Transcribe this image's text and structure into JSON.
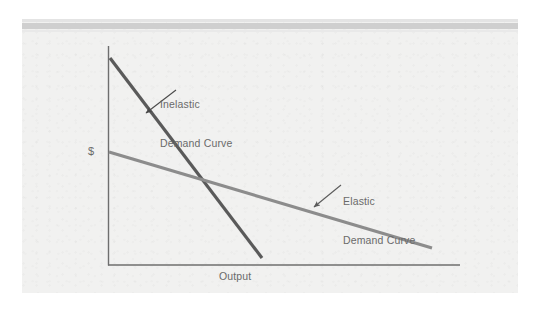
{
  "figure": {
    "background_color": "#f1f1f0",
    "page_color": "#ffffff"
  },
  "axes": {
    "y_label": "$",
    "x_label": "Output",
    "axis_color": "#6e6e6e"
  },
  "annotations": {
    "inelastic": {
      "line1": "Inelastic",
      "line2": "Demand Curve"
    },
    "elastic": {
      "line1": "Elastic",
      "line2": "Demand Curve"
    }
  },
  "chart_data": {
    "type": "line",
    "xlabel": "Output",
    "ylabel": "$",
    "grid": false,
    "legend": "none",
    "axis_origin_px": [
      108,
      265
    ],
    "axis_x_end_px": [
      460,
      265
    ],
    "axis_y_top_px": [
      108,
      46
    ],
    "xlim": [
      0,
      1
    ],
    "ylim": [
      0,
      1
    ],
    "series": [
      {
        "name": "Inelastic Demand Curve",
        "color": "#5a5a5a",
        "width_px": 3.2,
        "points_px": [
          [
            110,
            58
          ],
          [
            262,
            258
          ]
        ],
        "points_norm": [
          [
            0.006,
            0.945
          ],
          [
            0.438,
            0.032
          ]
        ],
        "slope_desc": "steep negative slope",
        "annotation": {
          "text_px": [
            160,
            72
          ],
          "arrow_from_px": [
            176,
            90
          ],
          "arrow_to_px": [
            146,
            113
          ]
        }
      },
      {
        "name": "Elastic Demand Curve",
        "color": "#8c8c8c",
        "width_px": 3.2,
        "points_px": [
          [
            109,
            152
          ],
          [
            432,
            248
          ]
        ],
        "points_norm": [
          [
            0.003,
            0.516
          ],
          [
            0.92,
            0.078
          ]
        ],
        "slope_desc": "shallow negative slope",
        "annotation": {
          "text_px": [
            343,
            169
          ],
          "arrow_from_px": [
            341,
            185
          ],
          "arrow_to_px": [
            314,
            207
          ]
        }
      }
    ],
    "intersection_px": [
      198,
      177
    ]
  }
}
